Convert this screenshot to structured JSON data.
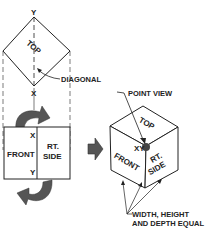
{
  "diagram": {
    "top_view": {
      "label": "TOP",
      "y_label": "Y",
      "x_label": "X",
      "diagonal_label": "DIAGONAL"
    },
    "front_side_view": {
      "front_label": "FRONT",
      "side_label_line1": "RT.",
      "side_label_line2": "SIDE",
      "x_label": "X",
      "y_label": "Y"
    },
    "cube": {
      "point_view_label": "POINT VIEW",
      "top_label": "TOP",
      "front_label": "FRONT",
      "side_label_line1": "RT.",
      "side_label_line2": "SIDE",
      "xy_label": "XY",
      "equal_label_line1": "WIDTH, HEIGHT",
      "equal_label_line2": "AND DEPTH EQUAL"
    },
    "colors": {
      "line": "#222222",
      "arrow_fill": "#555555"
    }
  }
}
